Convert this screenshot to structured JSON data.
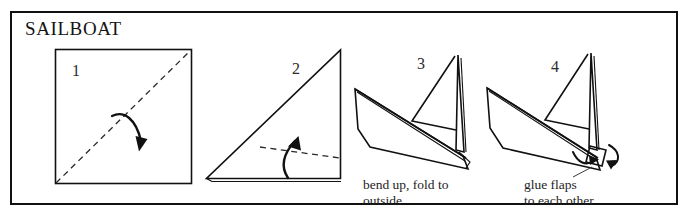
{
  "diagram": {
    "title": "SAILBOAT",
    "type": "origami-folding-instructions",
    "border_color": "#111111",
    "background_color": "#ffffff",
    "ink_color": "#111111"
  },
  "steps": [
    {
      "number": "1",
      "shape": "square",
      "fold_line": "dashed diagonal from bottom-left corner to top-right corner",
      "arrow": "curved arrow folding top-left half down across the diagonal",
      "caption": ""
    },
    {
      "number": "2",
      "shape": "right triangle, apex top-right",
      "fold_line": "dashed line across lower portion of triangle",
      "arrow": "curved arrow pointing up",
      "caption": ""
    },
    {
      "number": "3",
      "shape": "sailboat with hull and two sails",
      "fold_line": "",
      "arrow": "",
      "caption": "bend up, fold to\noutside"
    },
    {
      "number": "4",
      "shape": "sailboat with hull, two sails and stern flaps",
      "fold_line": "",
      "arrow": "two curved arrows converging on stern flap",
      "caption": "glue flaps\nto each other"
    }
  ]
}
